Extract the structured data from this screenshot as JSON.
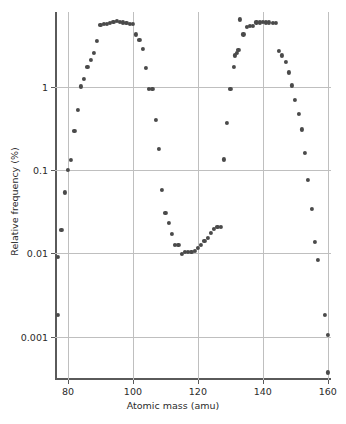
{
  "chart_data": {
    "type": "scatter",
    "title": "",
    "xlabel": "Atomic mass (amu)",
    "ylabel": "Relative frequency (%)",
    "xlim": [
      76,
      161
    ],
    "ylim": [
      0.0003,
      8
    ],
    "yscale": "log",
    "xscale": "linear",
    "grid": true,
    "legend": null,
    "xticks": [
      80,
      100,
      120,
      140,
      160
    ],
    "xticklabels": [
      "80",
      "100",
      "120",
      "140",
      "160"
    ],
    "yticks": [
      1,
      0.1,
      0.01,
      0.001
    ],
    "yticklabels": [
      "1",
      "0.1",
      "0.01",
      "0.001"
    ],
    "marker": "circle",
    "marker_color": "#4a4a4a",
    "series": [
      {
        "name": "Fission product yield",
        "x": [
          77,
          77,
          78,
          79,
          80,
          81,
          82,
          83,
          84,
          85,
          86,
          87,
          88,
          89,
          90,
          91,
          92,
          93,
          94,
          95,
          96,
          97,
          98,
          99,
          100,
          101,
          102,
          103,
          104,
          105,
          106,
          107,
          108,
          109,
          110,
          111,
          112,
          113,
          114,
          115,
          116,
          117,
          118,
          119,
          120,
          121,
          122,
          123,
          124,
          125,
          126,
          127,
          128,
          129,
          130,
          131,
          131.5,
          132,
          132.5,
          133,
          134,
          135,
          136,
          137,
          138,
          139,
          140,
          141,
          142,
          143,
          144,
          145,
          146,
          147,
          148,
          149,
          150,
          151,
          152,
          153,
          154,
          155,
          156,
          157,
          159,
          160,
          160
        ],
        "y": [
          0.0018,
          0.0091,
          0.019,
          0.054,
          0.1,
          0.133,
          0.3,
          0.53,
          1.02,
          1.25,
          1.75,
          2.1,
          2.6,
          3.6,
          5.6,
          5.7,
          5.8,
          5.9,
          6.1,
          6.2,
          6.1,
          6.0,
          5.9,
          5.8,
          5.8,
          4.3,
          3.7,
          2.9,
          1.7,
          0.95,
          0.95,
          0.4,
          0.18,
          0.058,
          0.031,
          0.023,
          0.017,
          0.0127,
          0.0127,
          0.0098,
          0.0103,
          0.0105,
          0.0105,
          0.0108,
          0.0117,
          0.0127,
          0.0142,
          0.0155,
          0.0175,
          0.0195,
          0.021,
          0.021,
          0.135,
          0.37,
          0.95,
          1.75,
          2.4,
          2.6,
          2.8,
          6.5,
          4.3,
          5.3,
          5.4,
          5.4,
          6.0,
          6.0,
          6.1,
          6.0,
          6.0,
          5.9,
          5.9,
          2.7,
          2.4,
          2.0,
          1.5,
          1.05,
          0.7,
          0.48,
          0.31,
          0.16,
          0.076,
          0.034,
          0.0138,
          0.0084,
          0.0018,
          0.00105,
          0.00037
        ]
      }
    ]
  }
}
